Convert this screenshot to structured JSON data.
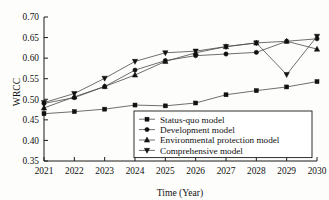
{
  "chart_data": {
    "type": "line",
    "title": "",
    "xlabel": "Time (Year)",
    "ylabel": "WRCC",
    "x": [
      2021,
      2022,
      2023,
      2024,
      2025,
      2026,
      2027,
      2028,
      2029,
      2030
    ],
    "xtick_labels": [
      "2021",
      "2022",
      "2023",
      "2024",
      "2025",
      "2026",
      "2027",
      "2028",
      "2029",
      "2030"
    ],
    "ytick_labels": [
      "0.35",
      "0.40",
      "0.45",
      "0.50",
      "0.55",
      "0.60",
      "0.65",
      "0.70"
    ],
    "ytick_values": [
      0.35,
      0.4,
      0.45,
      0.5,
      0.55,
      0.6,
      0.65,
      0.7
    ],
    "xlim": [
      2021,
      2030
    ],
    "ylim": [
      0.35,
      0.7
    ],
    "grid": false,
    "legend_position": "lower-right-inside",
    "series": [
      {
        "name": "Status-quo model",
        "marker": "square",
        "values": [
          0.465,
          0.47,
          0.476,
          0.486,
          0.484,
          0.491,
          0.511,
          0.521,
          0.53,
          0.543
        ]
      },
      {
        "name": "Development model",
        "marker": "circle",
        "values": [
          0.49,
          0.504,
          0.531,
          0.571,
          0.594,
          0.606,
          0.61,
          0.614,
          0.641,
          0.647
        ]
      },
      {
        "name": "Environmental protection model",
        "marker": "triangle-up",
        "values": [
          0.479,
          0.506,
          0.531,
          0.559,
          0.592,
          0.613,
          0.628,
          0.637,
          0.641,
          0.622
        ]
      },
      {
        "name": "Comprehensive model",
        "marker": "triangle-down",
        "values": [
          0.492,
          0.514,
          0.551,
          0.592,
          0.613,
          0.617,
          0.628,
          0.637,
          0.56,
          0.653
        ]
      }
    ]
  },
  "colors": {
    "axis": "#1a1a1a",
    "line": "#4a4a4a",
    "marker": "#111111",
    "background": "#fdfdfb"
  }
}
